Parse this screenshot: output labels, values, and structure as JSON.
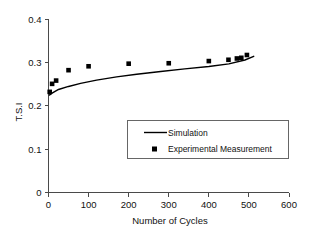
{
  "chart_data": {
    "type": "scatter",
    "title": "",
    "xlabel": "Number of  Cycles",
    "ylabel": "T.S.I",
    "xlim": [
      0,
      600
    ],
    "ylim": [
      0,
      0.4
    ],
    "xticks": [
      "0",
      "100",
      "200",
      "300",
      "400",
      "500",
      "600"
    ],
    "xtick_values": [
      0,
      100,
      200,
      300,
      400,
      500,
      600
    ],
    "yticks": [
      "0",
      "0.1",
      "0.2",
      "0.3",
      "0.4"
    ],
    "ytick_values": [
      0,
      0.1,
      0.2,
      0.3,
      0.4
    ],
    "grid": false,
    "legend_position": "center-right",
    "series": [
      {
        "name": "Simulation",
        "type": "line",
        "marker": "none",
        "x": [
          2,
          10,
          25,
          50,
          80,
          120,
          170,
          220,
          280,
          340,
          400,
          450,
          490,
          512
        ],
        "values": [
          0.2245,
          0.2295,
          0.2375,
          0.2445,
          0.2515,
          0.259,
          0.2665,
          0.2725,
          0.279,
          0.285,
          0.2905,
          0.2965,
          0.3055,
          0.314
        ]
      },
      {
        "name": "Experimental Measurement",
        "type": "scatter",
        "marker": "square",
        "x": [
          3,
          9,
          19,
          50,
          100,
          200,
          300,
          400,
          449,
          470,
          481,
          495
        ],
        "values": [
          0.232,
          0.2505,
          0.258,
          0.282,
          0.291,
          0.297,
          0.298,
          0.303,
          0.306,
          0.309,
          0.3105,
          0.317
        ]
      }
    ],
    "legend_entries": [
      {
        "label": "Simulation",
        "style": "line"
      },
      {
        "label": "Experimental Measurement",
        "style": "square-marker"
      }
    ],
    "colors": {
      "line": "#000000",
      "marker": "#000000",
      "axis": "#4a4a4a",
      "background": "#ffffff",
      "text": "#111111"
    }
  }
}
